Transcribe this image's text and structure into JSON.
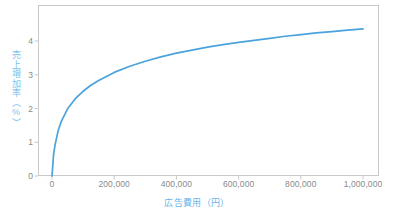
{
  "chart_data": {
    "type": "line",
    "title": "",
    "subtitle": "",
    "xlabel": "広告費用（円）",
    "ylabel": "売上増加率（%）",
    "xlim": [
      0,
      1000000
    ],
    "ylim": [
      0,
      4.8
    ],
    "grid": false,
    "legend": null,
    "series": [
      {
        "name": "売上増加率",
        "color": "#4ba3dd",
        "x": [
          0,
          5000,
          10000,
          20000,
          30000,
          50000,
          75000,
          100000,
          125000,
          150000,
          200000,
          250000,
          300000,
          350000,
          400000,
          450000,
          500000,
          550000,
          600000,
          650000,
          700000,
          750000,
          800000,
          850000,
          900000,
          950000,
          1000000
        ],
        "y": [
          0.0,
          0.63,
          0.93,
          1.35,
          1.62,
          1.99,
          2.29,
          2.51,
          2.69,
          2.83,
          3.07,
          3.25,
          3.4,
          3.53,
          3.64,
          3.73,
          3.82,
          3.89,
          3.96,
          4.02,
          4.08,
          4.14,
          4.19,
          4.24,
          4.28,
          4.32,
          4.36
        ],
        "annotation": "logarithmic diminishing-returns curve"
      }
    ],
    "xticks": [
      {
        "value": 0,
        "label": "0"
      },
      {
        "value": 200000,
        "label": "200,000"
      },
      {
        "value": 400000,
        "label": "400,000"
      },
      {
        "value": 600000,
        "label": "600,000"
      },
      {
        "value": 800000,
        "label": "800,000"
      },
      {
        "value": 1000000,
        "label": "1,000,000"
      }
    ],
    "yticks": [
      {
        "value": 0,
        "label": "0"
      },
      {
        "value": 1,
        "label": "1"
      },
      {
        "value": 2,
        "label": "2"
      },
      {
        "value": 3,
        "label": "3"
      },
      {
        "value": 4,
        "label": "4"
      }
    ],
    "colors": {
      "line": "#4ba3dd",
      "axis": "#c9c9c9",
      "tick_text": "#8a8a8a",
      "xlabel_text": "#6ab4e8",
      "ylabel_text": "#7ec2ee",
      "background": "#ffffff"
    }
  }
}
